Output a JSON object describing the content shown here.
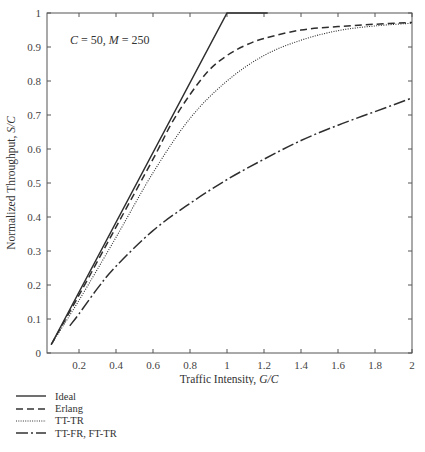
{
  "chart_data": {
    "type": "line",
    "title": "",
    "annotation": "C = 50, M = 250",
    "xlabel": "Traffic Intensity, G/C",
    "ylabel": "Normalized Throughput, S/C",
    "xlim": [
      0.05,
      2
    ],
    "ylim": [
      0,
      1
    ],
    "xticks": [
      0.2,
      0.4,
      0.6,
      0.8,
      1,
      1.2,
      1.4,
      1.6,
      1.8,
      2
    ],
    "xtick_labels": [
      "0.2",
      "0.4",
      "0.6",
      "0.8",
      "1",
      "1.2",
      "1.4",
      "1.6",
      "1.8",
      "2"
    ],
    "yticks": [
      0,
      0.1,
      0.2,
      0.3,
      0.4,
      0.5,
      0.6,
      0.7,
      0.8,
      0.9,
      1
    ],
    "ytick_labels": [
      "0",
      "0.1",
      "0.2",
      "0.3",
      "0.4",
      "0.5",
      "0.6",
      "0.7",
      "0.8",
      "0.9",
      "1"
    ],
    "grid": false,
    "legend_position": "below-left",
    "series": [
      {
        "name": "Ideal",
        "style": "solid",
        "x": [
          0.05,
          1.0,
          1.22
        ],
        "y": [
          0.025,
          1.0,
          1.0
        ]
      },
      {
        "name": "Erlang",
        "style": "dashed",
        "x": [
          0.05,
          0.2,
          0.4,
          0.6,
          0.7,
          0.8,
          0.9,
          1.0,
          1.1,
          1.2,
          1.4,
          1.6,
          1.8,
          2.0
        ],
        "y": [
          0.025,
          0.17,
          0.37,
          0.57,
          0.675,
          0.76,
          0.83,
          0.875,
          0.905,
          0.925,
          0.95,
          0.96,
          0.967,
          0.972
        ]
      },
      {
        "name": "TT-TR",
        "style": "dotted",
        "x": [
          0.05,
          0.2,
          0.4,
          0.6,
          0.8,
          1.0,
          1.2,
          1.4,
          1.6,
          1.8,
          2.0
        ],
        "y": [
          0.025,
          0.155,
          0.34,
          0.53,
          0.69,
          0.8,
          0.875,
          0.92,
          0.948,
          0.962,
          0.97
        ]
      },
      {
        "name": "TT-FR, FT-TR",
        "style": "dashdot",
        "x": [
          0.15,
          0.2,
          0.3,
          0.4,
          0.6,
          0.8,
          1.0,
          1.2,
          1.4,
          1.6,
          1.8,
          2.0
        ],
        "y": [
          0.08,
          0.115,
          0.19,
          0.255,
          0.36,
          0.44,
          0.51,
          0.57,
          0.625,
          0.67,
          0.71,
          0.75
        ]
      }
    ]
  },
  "legend": {
    "items": [
      {
        "label": "Ideal",
        "style": "solid"
      },
      {
        "label": "Erlang",
        "style": "dashed"
      },
      {
        "label": "TT-TR",
        "style": "dotted"
      },
      {
        "label": "TT-FR, FT-TR",
        "style": "dashdot"
      }
    ]
  }
}
